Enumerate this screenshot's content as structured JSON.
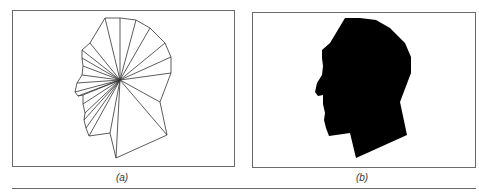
{
  "figure": {
    "panels": [
      {
        "id": "a",
        "caption": "(a)",
        "description": "Head profile outline triangulated as a fan from a single interior hub point",
        "hub": [
          120,
          80
        ],
        "outline": [
          [
            105,
            18
          ],
          [
            120,
            18
          ],
          [
            136,
            20
          ],
          [
            150,
            28
          ],
          [
            165,
            43
          ],
          [
            171,
            57
          ],
          [
            171,
            73
          ],
          [
            160,
            102
          ],
          [
            167,
            135
          ],
          [
            116,
            158
          ],
          [
            110,
            133
          ],
          [
            89,
            136
          ],
          [
            86,
            128
          ],
          [
            84,
            120
          ],
          [
            85,
            113
          ],
          [
            83,
            104
          ],
          [
            83,
            95
          ],
          [
            78,
            96
          ],
          [
            75,
            92
          ],
          [
            77,
            83
          ],
          [
            82,
            75
          ],
          [
            83,
            66
          ],
          [
            82,
            58
          ],
          [
            82,
            50
          ],
          [
            90,
            43
          ]
        ],
        "stroke_color": "#333333"
      },
      {
        "id": "b",
        "caption": "(b)",
        "description": "Filled black silhouette of the same head profile",
        "outline": [
          [
            345,
            18
          ],
          [
            360,
            18
          ],
          [
            376,
            20
          ],
          [
            390,
            28
          ],
          [
            405,
            43
          ],
          [
            411,
            57
          ],
          [
            411,
            73
          ],
          [
            400,
            102
          ],
          [
            407,
            135
          ],
          [
            356,
            158
          ],
          [
            350,
            133
          ],
          [
            329,
            136
          ],
          [
            326,
            128
          ],
          [
            324,
            120
          ],
          [
            325,
            113
          ],
          [
            323,
            104
          ],
          [
            323,
            95
          ],
          [
            318,
            96
          ],
          [
            315,
            92
          ],
          [
            317,
            83
          ],
          [
            322,
            75
          ],
          [
            323,
            66
          ],
          [
            322,
            58
          ],
          [
            322,
            50
          ],
          [
            330,
            43
          ]
        ],
        "fill_color": "#000000"
      }
    ]
  }
}
